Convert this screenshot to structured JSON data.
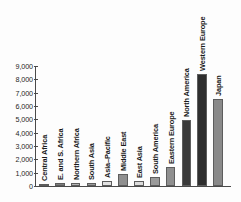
{
  "chart_data": {
    "type": "bar",
    "title": "",
    "xlabel": "",
    "ylabel": "",
    "ylim": [
      0,
      9000
    ],
    "ytick_labels": [
      "9,000",
      "8,000",
      "7,000",
      "6,000",
      "5,000",
      "4,000",
      "3,000",
      "2,000",
      "1,000",
      "0"
    ],
    "ytick_values": [
      9000,
      8000,
      7000,
      6000,
      5000,
      4000,
      3000,
      2000,
      1000,
      0
    ],
    "grid": false,
    "legend": "none",
    "categories": [
      "Central Africa",
      "E. and S. Africa",
      "Northern Africa",
      "South Asia",
      "Asia–Pacific",
      "Middle East",
      "East Asia",
      "South America",
      "Eastern Europe",
      "North America",
      "Western Europe",
      "Japan"
    ],
    "values": [
      120,
      200,
      230,
      200,
      380,
      900,
      390,
      700,
      1400,
      4950,
      8400,
      6500
    ],
    "bar_colors": [
      "#9a9a9a",
      "#7d7d7d",
      "#b4b4b4",
      "#9a9a9a",
      "#e2e2e2",
      "#8f8f8f",
      "#dcdcdc",
      "#9a9a9a",
      "#8f8f8f",
      "#3a3a3a",
      "#2e2e2e",
      "#8a8a8a"
    ]
  },
  "colors": {
    "axis": "#4a4a4a",
    "text": "#1a1a1a",
    "background": "#fdfdfd"
  }
}
